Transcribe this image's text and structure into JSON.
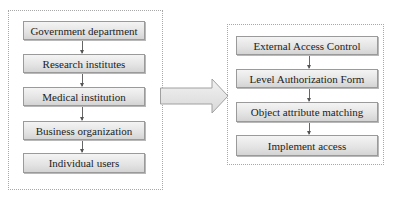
{
  "left_group": {
    "nodes": [
      {
        "label": "Government department"
      },
      {
        "label": "Research institutes"
      },
      {
        "label": "Medical institution"
      },
      {
        "label": "Business organization"
      },
      {
        "label": "Individual users"
      }
    ]
  },
  "transition_arrow": {
    "icon": "block-arrow-right"
  },
  "right_group": {
    "nodes": [
      {
        "label": "External Access Control"
      },
      {
        "label": "Level Authorization Form"
      },
      {
        "label": "Object attribute matching"
      },
      {
        "label": "Implement access"
      }
    ]
  },
  "colors": {
    "node_fill": "#e3e3e3",
    "node_border": "#9a9a9a",
    "group_border": "#a8a8a8",
    "arrow_fill": "#e6e6e6"
  }
}
